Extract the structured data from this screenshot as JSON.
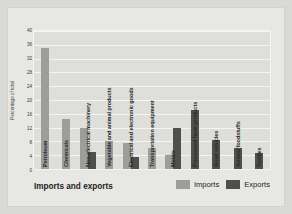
{
  "chart_data": {
    "type": "bar",
    "title": "",
    "xlabel": "Imports and exports",
    "ylabel": "Percentage of total",
    "ylim": [
      0,
      40
    ],
    "ytick_step": 4,
    "yticks": [
      "0",
      "4",
      "8",
      "12",
      "16",
      "20",
      "24",
      "28",
      "32",
      "36",
      "40"
    ],
    "grid": true,
    "legend_position": "bottom-right",
    "categories": [
      "Petroleum",
      "Chemicals",
      "Non-electrical machinery",
      "Vegetable and animal products",
      "Electrical and electronic goods",
      "Transportation equipment",
      "Metals",
      "Processed farm products",
      "Road vehicles",
      "Animal foodstuffs",
      "Textiles"
    ],
    "series": [
      {
        "name": "Imports",
        "color": "#9d9d9b",
        "values": [
          35.0,
          14.5,
          12.0,
          8.0,
          7.5,
          6.0,
          4.2,
          null,
          null,
          null,
          null
        ]
      },
      {
        "name": "Exports",
        "color": "#4f4f4f",
        "values": [
          null,
          null,
          5.0,
          null,
          3.5,
          null,
          12.0,
          17.0,
          8.3,
          6.0,
          4.5
        ]
      }
    ]
  },
  "legend": {
    "imports_label": "Imports",
    "exports_label": "Exports"
  }
}
